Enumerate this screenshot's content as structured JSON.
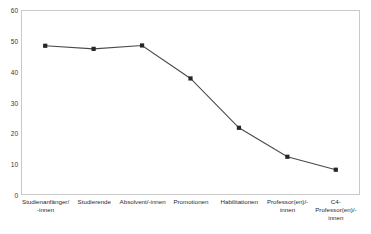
{
  "chart_data": {
    "type": "line",
    "title": "",
    "subtitle": "",
    "xlabel": "",
    "ylabel": "",
    "categories": [
      "Studienanfänger/\n-innen",
      "Studierende",
      "Absolvent/-innen",
      "Promotionen",
      "Habilitationen",
      "Professor(en)/-\ninnen",
      "C4-\nProfessor(en)/-\ninnen"
    ],
    "values": [
      48.4,
      47.4,
      48.5,
      37.8,
      21.8,
      12.4,
      8.2
    ],
    "ylim": [
      0,
      60
    ],
    "ytick_labels": [
      "0",
      "10",
      "20",
      "30",
      "40",
      "50",
      "60"
    ],
    "ytick_values": [
      0,
      10,
      20,
      30,
      40,
      50,
      60
    ],
    "grid": false,
    "legend": false,
    "legend_position": "none",
    "series_color": "#4a4a4a",
    "marker": "square",
    "marker_color": "#262626",
    "plot_border_color": "#c9c9c9",
    "background_color": "#ffffff"
  }
}
